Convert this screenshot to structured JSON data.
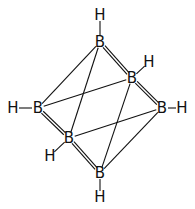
{
  "diagram": {
    "title": "",
    "type": "molecular-structure",
    "atoms": [
      {
        "id": "B1",
        "label": "B",
        "x": 100,
        "y": 42
      },
      {
        "id": "B2",
        "label": "B",
        "x": 132,
        "y": 78
      },
      {
        "id": "B3",
        "label": "B",
        "x": 38,
        "y": 108
      },
      {
        "id": "B4",
        "label": "B",
        "x": 162,
        "y": 108
      },
      {
        "id": "B5",
        "label": "B",
        "x": 69,
        "y": 138
      },
      {
        "id": "B6",
        "label": "B",
        "x": 100,
        "y": 173
      },
      {
        "id": "H1",
        "label": "H",
        "x": 100,
        "y": 15
      },
      {
        "id": "H2",
        "label": "H",
        "x": 149,
        "y": 62
      },
      {
        "id": "H3",
        "label": "H",
        "x": 13,
        "y": 108
      },
      {
        "id": "H4",
        "label": "H",
        "x": 182,
        "y": 108
      },
      {
        "id": "H5",
        "label": "H",
        "x": 50,
        "y": 156
      },
      {
        "id": "H6",
        "label": "H",
        "x": 100,
        "y": 197
      }
    ],
    "bonds": [
      {
        "from": "B1",
        "to": "B3",
        "order": 1
      },
      {
        "from": "B1",
        "to": "B5",
        "order": 1
      },
      {
        "from": "B1",
        "to": "B2",
        "order": 2
      },
      {
        "from": "B2",
        "to": "B4",
        "order": 2
      },
      {
        "from": "B3",
        "to": "B2",
        "order": 1
      },
      {
        "from": "B3",
        "to": "B5",
        "order": 2
      },
      {
        "from": "B5",
        "to": "B6",
        "order": 2
      },
      {
        "from": "B5",
        "to": "B4",
        "order": 1
      },
      {
        "from": "B2",
        "to": "B6",
        "order": 1
      },
      {
        "from": "B4",
        "to": "B6",
        "order": 1
      },
      {
        "from": "B1",
        "to": "H1",
        "order": 1
      },
      {
        "from": "B2",
        "to": "H2",
        "order": 1
      },
      {
        "from": "B3",
        "to": "H3",
        "order": 1
      },
      {
        "from": "B4",
        "to": "H4",
        "order": 1
      },
      {
        "from": "B5",
        "to": "H5",
        "order": 1
      },
      {
        "from": "B6",
        "to": "H6",
        "order": 1
      }
    ],
    "colors": {
      "ink": "#111111",
      "background": "#ffffff"
    }
  }
}
